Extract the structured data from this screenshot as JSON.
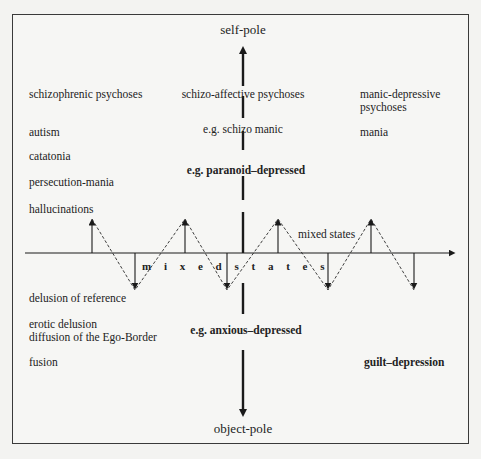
{
  "diagram": {
    "poles": {
      "top": "self-pole",
      "bottom": "object-pole"
    },
    "left_upper": {
      "heading": "schizophrenic psychoses",
      "items": [
        "autism",
        "catatonia",
        "persecution-mania",
        "hallucinations"
      ]
    },
    "center_upper": {
      "heading": "schizo-affective psychoses",
      "example1": "e.g. schizo manic",
      "example2": "e.g. paranoid–depressed"
    },
    "right_upper": {
      "heading_line1": "manic-depressive",
      "heading_line2": "psychoses",
      "item": "mania"
    },
    "axis": {
      "center_label": "m i x e d   s t a t e s",
      "right_label": "mixed states"
    },
    "left_lower": {
      "items": [
        "delusion of reference",
        "erotic delusion",
        "diffusion of the Ego-Border",
        "fusion"
      ]
    },
    "center_lower": {
      "example": "e.g. anxious–depressed"
    },
    "right_lower": {
      "item": "guilt–depression"
    },
    "colors": {
      "line": "#1a1a1a",
      "background": "#f6f6f4"
    }
  }
}
